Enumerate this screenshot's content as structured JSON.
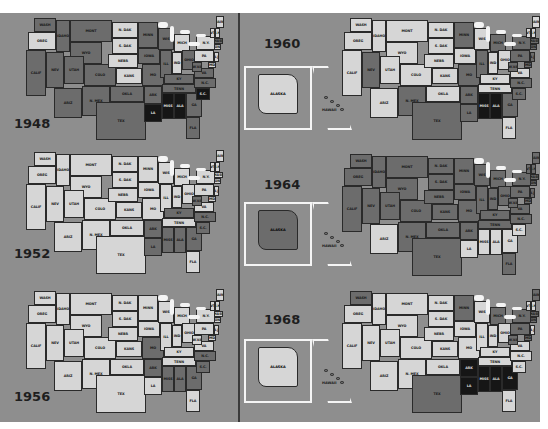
{
  "figure": {
    "colors": {
      "light": "#d6d6d6",
      "medium": "#6c6c6c",
      "black": "#161616",
      "background": "#8e8e8e",
      "lake": "#f4f4f4"
    }
  },
  "states": [
    {
      "id": "WA",
      "label": "WASH",
      "x": 10,
      "y": 2,
      "w": 22,
      "h": 14
    },
    {
      "id": "OR",
      "label": "OREG",
      "x": 4,
      "y": 16,
      "w": 28,
      "h": 18
    },
    {
      "id": "CA",
      "label": "CALIF",
      "x": 2,
      "y": 34,
      "w": 20,
      "h": 46
    },
    {
      "id": "ID",
      "label": "IDAHO",
      "x": 32,
      "y": 4,
      "w": 14,
      "h": 32
    },
    {
      "id": "NV",
      "label": "NEV",
      "x": 22,
      "y": 36,
      "w": 18,
      "h": 36
    },
    {
      "id": "MT",
      "label": "MONT",
      "x": 46,
      "y": 4,
      "w": 42,
      "h": 22
    },
    {
      "id": "WY",
      "label": "WYO",
      "x": 46,
      "y": 26,
      "w": 32,
      "h": 22
    },
    {
      "id": "UT",
      "label": "UTAH",
      "x": 40,
      "y": 40,
      "w": 20,
      "h": 28
    },
    {
      "id": "CO",
      "label": "COLO",
      "x": 60,
      "y": 48,
      "w": 32,
      "h": 22
    },
    {
      "id": "AZ",
      "label": "ARIZ",
      "x": 30,
      "y": 72,
      "w": 28,
      "h": 30
    },
    {
      "id": "NM",
      "label": "N. MEX",
      "x": 58,
      "y": 70,
      "w": 28,
      "h": 30
    },
    {
      "id": "ND",
      "label": "N. DAK",
      "x": 88,
      "y": 6,
      "w": 26,
      "h": 16
    },
    {
      "id": "SD",
      "label": "S. DAK",
      "x": 88,
      "y": 22,
      "w": 26,
      "h": 16
    },
    {
      "id": "NE",
      "label": "NEBR",
      "x": 84,
      "y": 38,
      "w": 30,
      "h": 14
    },
    {
      "id": "KS",
      "label": "KANS",
      "x": 92,
      "y": 52,
      "w": 26,
      "h": 16
    },
    {
      "id": "OK",
      "label": "OKLA",
      "x": 86,
      "y": 70,
      "w": 34,
      "h": 16
    },
    {
      "id": "TX",
      "label": "TEX",
      "x": 72,
      "y": 86,
      "w": 50,
      "h": 38
    },
    {
      "id": "MN",
      "label": "MINN",
      "x": 114,
      "y": 6,
      "w": 20,
      "h": 26
    },
    {
      "id": "IA",
      "label": "IOWA",
      "x": 114,
      "y": 32,
      "w": 22,
      "h": 16
    },
    {
      "id": "MO",
      "label": "MO",
      "x": 118,
      "y": 48,
      "w": 22,
      "h": 22
    },
    {
      "id": "AR",
      "label": "ARK",
      "x": 120,
      "y": 70,
      "w": 18,
      "h": 18
    },
    {
      "id": "LA",
      "label": "LA",
      "x": 120,
      "y": 88,
      "w": 18,
      "h": 18
    },
    {
      "id": "WI",
      "label": "WIS",
      "x": 134,
      "y": 12,
      "w": 16,
      "h": 22
    },
    {
      "id": "IL",
      "label": "ILL",
      "x": 136,
      "y": 34,
      "w": 12,
      "h": 28
    },
    {
      "id": "MI",
      "label": "MICH",
      "x": 150,
      "y": 18,
      "w": 16,
      "h": 18
    },
    {
      "id": "IN",
      "label": "IND",
      "x": 148,
      "y": 36,
      "w": 10,
      "h": 22
    },
    {
      "id": "OH",
      "label": "OHIO",
      "x": 158,
      "y": 34,
      "w": 14,
      "h": 20
    },
    {
      "id": "KY",
      "label": "KY",
      "x": 140,
      "y": 58,
      "w": 30,
      "h": 10
    },
    {
      "id": "TN",
      "label": "TENN",
      "x": 138,
      "y": 68,
      "w": 34,
      "h": 9
    },
    {
      "id": "MS",
      "label": "MISS",
      "x": 138,
      "y": 77,
      "w": 12,
      "h": 26
    },
    {
      "id": "AL",
      "label": "ALA",
      "x": 150,
      "y": 77,
      "w": 12,
      "h": 26
    },
    {
      "id": "GA",
      "label": "GA",
      "x": 162,
      "y": 77,
      "w": 16,
      "h": 24
    },
    {
      "id": "FL",
      "label": "FLA",
      "x": 162,
      "y": 101,
      "w": 14,
      "h": 22
    },
    {
      "id": "SC",
      "label": "S.C.",
      "x": 172,
      "y": 72,
      "w": 14,
      "h": 12
    },
    {
      "id": "NC",
      "label": "N.C.",
      "x": 170,
      "y": 62,
      "w": 22,
      "h": 10
    },
    {
      "id": "VA",
      "label": "VA",
      "x": 170,
      "y": 52,
      "w": 20,
      "h": 10
    },
    {
      "id": "WV",
      "label": "W.VA",
      "x": 168,
      "y": 46,
      "w": 10,
      "h": 10
    },
    {
      "id": "PA",
      "label": "PA",
      "x": 170,
      "y": 34,
      "w": 20,
      "h": 12
    },
    {
      "id": "NY",
      "label": "N.Y.",
      "x": 172,
      "y": 20,
      "w": 20,
      "h": 14
    },
    {
      "id": "MD",
      "label": "MD",
      "x": 184,
      "y": 46,
      "w": 8,
      "h": 6
    },
    {
      "id": "NJ",
      "label": "N.J.",
      "x": 190,
      "y": 36,
      "w": 5,
      "h": 10
    },
    {
      "id": "CT",
      "label": "CONN",
      "x": 190,
      "y": 28,
      "w": 7,
      "h": 6
    },
    {
      "id": "MA",
      "label": "MASS",
      "x": 190,
      "y": 22,
      "w": 9,
      "h": 6
    },
    {
      "id": "VT",
      "label": "VT",
      "x": 186,
      "y": 12,
      "w": 5,
      "h": 10
    },
    {
      "id": "NH",
      "label": "N.H.",
      "x": 191,
      "y": 12,
      "w": 5,
      "h": 10
    },
    {
      "id": "ME",
      "label": "MAINE",
      "x": 192,
      "y": 0,
      "w": 8,
      "h": 12
    }
  ],
  "panels": [
    {
      "year": "1948",
      "has_insets": false,
      "colors": {
        "WA": "medium",
        "OR": "light",
        "CA": "medium",
        "ID": "medium",
        "NV": "medium",
        "MT": "medium",
        "WY": "medium",
        "UT": "medium",
        "CO": "medium",
        "AZ": "medium",
        "NM": "medium",
        "ND": "light",
        "SD": "light",
        "NE": "light",
        "KS": "light",
        "OK": "medium",
        "TX": "medium",
        "MN": "medium",
        "IA": "medium",
        "MO": "medium",
        "AR": "medium",
        "LA": "black",
        "WI": "medium",
        "IL": "medium",
        "MI": "light",
        "IN": "light",
        "OH": "medium",
        "KY": "medium",
        "TN": "medium",
        "MS": "black",
        "AL": "black",
        "GA": "medium",
        "FL": "medium",
        "SC": "black",
        "NC": "medium",
        "VA": "medium",
        "WV": "medium",
        "PA": "light",
        "NY": "light",
        "MD": "light",
        "NJ": "light",
        "CT": "light",
        "MA": "medium",
        "VT": "light",
        "NH": "light",
        "ME": "light"
      }
    },
    {
      "year": "1952",
      "has_insets": false,
      "colors": {
        "WA": "light",
        "OR": "light",
        "CA": "light",
        "ID": "light",
        "NV": "light",
        "MT": "light",
        "WY": "light",
        "UT": "light",
        "CO": "light",
        "AZ": "light",
        "NM": "light",
        "ND": "light",
        "SD": "light",
        "NE": "light",
        "KS": "light",
        "OK": "light",
        "TX": "light",
        "MN": "light",
        "IA": "light",
        "MO": "light",
        "AR": "medium",
        "LA": "medium",
        "WI": "light",
        "IL": "light",
        "MI": "light",
        "IN": "light",
        "OH": "light",
        "KY": "medium",
        "TN": "light",
        "MS": "medium",
        "AL": "medium",
        "GA": "medium",
        "FL": "light",
        "SC": "medium",
        "NC": "medium",
        "VA": "light",
        "WV": "medium",
        "PA": "light",
        "NY": "light",
        "MD": "light",
        "NJ": "light",
        "CT": "light",
        "MA": "light",
        "VT": "light",
        "NH": "light",
        "ME": "light"
      }
    },
    {
      "year": "1956",
      "has_insets": false,
      "colors": {
        "WA": "light",
        "OR": "light",
        "CA": "light",
        "ID": "light",
        "NV": "light",
        "MT": "light",
        "WY": "light",
        "UT": "light",
        "CO": "light",
        "AZ": "light",
        "NM": "light",
        "ND": "light",
        "SD": "light",
        "NE": "light",
        "KS": "light",
        "OK": "light",
        "TX": "light",
        "MN": "light",
        "IA": "light",
        "MO": "medium",
        "AR": "medium",
        "LA": "light",
        "WI": "light",
        "IL": "light",
        "MI": "light",
        "IN": "light",
        "OH": "light",
        "KY": "light",
        "TN": "light",
        "MS": "medium",
        "AL": "medium",
        "GA": "medium",
        "FL": "light",
        "SC": "medium",
        "NC": "medium",
        "VA": "light",
        "WV": "light",
        "PA": "light",
        "NY": "light",
        "MD": "light",
        "NJ": "light",
        "CT": "light",
        "MA": "light",
        "VT": "light",
        "NH": "light",
        "ME": "light"
      }
    },
    {
      "year": "1960",
      "has_insets": true,
      "alaska": "light",
      "hawaii": "medium",
      "colors": {
        "WA": "light",
        "OR": "light",
        "CA": "light",
        "ID": "light",
        "NV": "medium",
        "MT": "light",
        "WY": "light",
        "UT": "light",
        "CO": "light",
        "AZ": "light",
        "NM": "medium",
        "ND": "light",
        "SD": "light",
        "NE": "light",
        "KS": "light",
        "OK": "light",
        "TX": "medium",
        "MN": "medium",
        "IA": "light",
        "MO": "medium",
        "AR": "medium",
        "LA": "medium",
        "WI": "light",
        "IL": "medium",
        "MI": "medium",
        "IN": "light",
        "OH": "light",
        "KY": "light",
        "TN": "light",
        "MS": "black",
        "AL": "black",
        "GA": "medium",
        "FL": "light",
        "SC": "medium",
        "NC": "medium",
        "VA": "light",
        "WV": "medium",
        "PA": "medium",
        "NY": "medium",
        "MD": "medium",
        "NJ": "medium",
        "CT": "medium",
        "MA": "medium",
        "VT": "light",
        "NH": "light",
        "ME": "light"
      }
    },
    {
      "year": "1964",
      "has_insets": true,
      "alaska": "medium",
      "hawaii": "medium",
      "colors": {
        "WA": "medium",
        "OR": "medium",
        "CA": "medium",
        "ID": "medium",
        "NV": "medium",
        "MT": "medium",
        "WY": "medium",
        "UT": "medium",
        "CO": "medium",
        "AZ": "light",
        "NM": "medium",
        "ND": "medium",
        "SD": "medium",
        "NE": "medium",
        "KS": "medium",
        "OK": "medium",
        "TX": "medium",
        "MN": "medium",
        "IA": "medium",
        "MO": "medium",
        "AR": "medium",
        "LA": "light",
        "WI": "medium",
        "IL": "medium",
        "MI": "medium",
        "IN": "medium",
        "OH": "medium",
        "KY": "medium",
        "TN": "medium",
        "MS": "light",
        "AL": "light",
        "GA": "light",
        "FL": "medium",
        "SC": "light",
        "NC": "medium",
        "VA": "medium",
        "WV": "medium",
        "PA": "medium",
        "NY": "medium",
        "MD": "medium",
        "NJ": "medium",
        "CT": "medium",
        "MA": "medium",
        "VT": "medium",
        "NH": "medium",
        "ME": "medium"
      }
    },
    {
      "year": "1968",
      "has_insets": true,
      "alaska": "light",
      "hawaii": "medium",
      "colors": {
        "WA": "medium",
        "OR": "light",
        "CA": "light",
        "ID": "light",
        "NV": "light",
        "MT": "light",
        "WY": "light",
        "UT": "light",
        "CO": "light",
        "AZ": "light",
        "NM": "light",
        "ND": "light",
        "SD": "light",
        "NE": "light",
        "KS": "light",
        "OK": "light",
        "TX": "medium",
        "MN": "medium",
        "IA": "light",
        "MO": "light",
        "AR": "black",
        "LA": "black",
        "WI": "light",
        "IL": "light",
        "MI": "medium",
        "IN": "light",
        "OH": "light",
        "KY": "light",
        "TN": "light",
        "MS": "black",
        "AL": "black",
        "GA": "black",
        "FL": "light",
        "SC": "light",
        "NC": "light",
        "VA": "light",
        "WV": "medium",
        "PA": "medium",
        "NY": "medium",
        "MD": "medium",
        "NJ": "light",
        "CT": "medium",
        "MA": "medium",
        "VT": "light",
        "NH": "light",
        "ME": "medium"
      }
    }
  ],
  "insets": {
    "alaska_label": "ALASKA",
    "hawaii_label": "HAWAII"
  }
}
